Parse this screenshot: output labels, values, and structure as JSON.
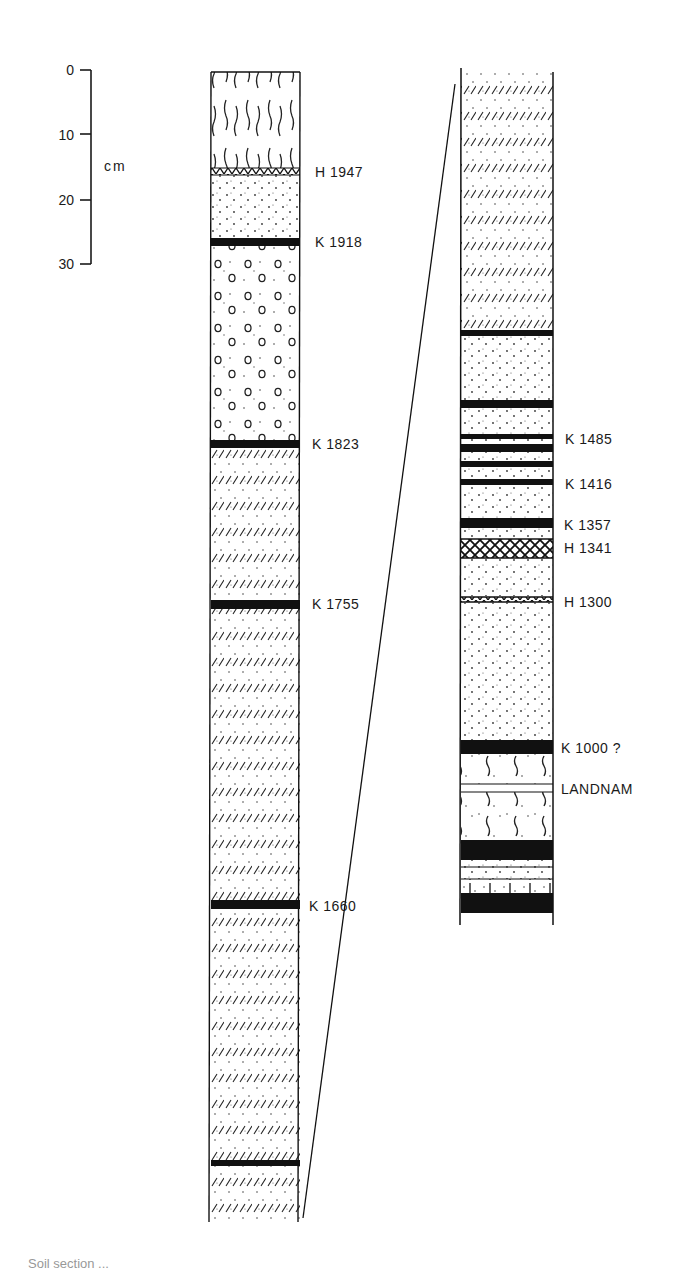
{
  "figure": {
    "type": "stratigraphic soil section with tephra layers",
    "scale_bar": {
      "unit_label": "cm",
      "ticks": [
        "0",
        "10",
        "20",
        "30"
      ]
    },
    "left_column": {
      "labels": [
        {
          "id": "h1947",
          "text": "H 1947"
        },
        {
          "id": "k1918",
          "text": "K 1918"
        },
        {
          "id": "k1823",
          "text": "K 1823"
        },
        {
          "id": "k1755",
          "text": "K 1755"
        },
        {
          "id": "k1660",
          "text": "K 1660"
        }
      ]
    },
    "right_column": {
      "labels": [
        {
          "id": "k1485",
          "text": "K 1485"
        },
        {
          "id": "k1416",
          "text": "K 1416"
        },
        {
          "id": "k1357",
          "text": "K 1357"
        },
        {
          "id": "h1341",
          "text": "H 1341"
        },
        {
          "id": "h1300",
          "text": "H 1300"
        },
        {
          "id": "k1000",
          "text": "K 1000 ?"
        },
        {
          "id": "landnam",
          "text": "LANDNAM"
        }
      ]
    },
    "legend_patterns": {
      "peat": "wavy vertical strokes",
      "dotted": "fine dots (aeolian sand/soil)",
      "hatched": "diagonal strokes with dots",
      "circles": "small rings with dots",
      "black": "dark tephra layer (K = Katla)",
      "crosshatch": "light tephra (H = Hekla)"
    },
    "caption_partial": "Soil section ..."
  }
}
